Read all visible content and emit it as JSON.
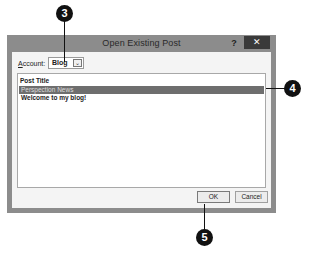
{
  "dialog": {
    "title": "Open Existing Post",
    "help_label": "?",
    "close_label": "✕",
    "account": {
      "label_accel": "A",
      "label_rest": "ccount:",
      "value": "Blog",
      "arrow": "⌄"
    },
    "list": {
      "header": "Post Title",
      "rows": [
        {
          "title": "Perspection News",
          "selected": true
        },
        {
          "title": "Welcome to my blog!",
          "selected": false
        }
      ]
    },
    "buttons": {
      "ok": "OK",
      "cancel": "Cancel"
    }
  },
  "callouts": [
    {
      "number": "3",
      "target": "account-dropdown"
    },
    {
      "number": "4",
      "target": "selected-post"
    },
    {
      "number": "5",
      "target": "ok-button"
    }
  ]
}
